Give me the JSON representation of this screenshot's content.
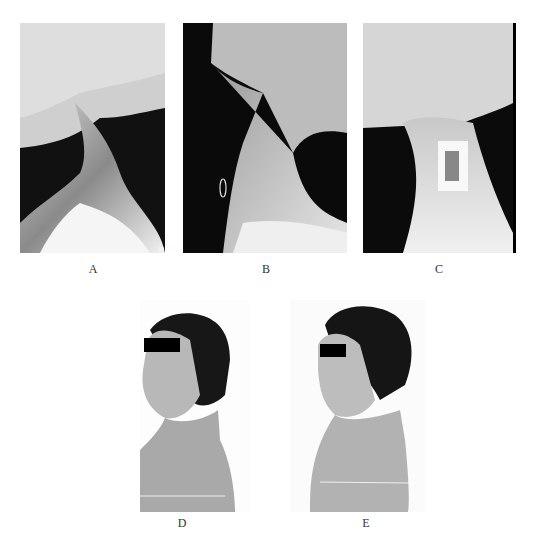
{
  "figure": {
    "panels": [
      {
        "id": "A",
        "label": "A",
        "type": "x-ray",
        "view": "lateral cervical spine",
        "overlay_text": "100"
      },
      {
        "id": "B",
        "label": "B",
        "type": "x-ray",
        "view": "lateral cervical spine"
      },
      {
        "id": "C",
        "label": "C",
        "type": "x-ray",
        "view": "lateral cervical spine with anterior plate fixation"
      },
      {
        "id": "D",
        "label": "D",
        "type": "photo",
        "view": "lateral profile, patient with eye bar"
      },
      {
        "id": "E",
        "label": "E",
        "type": "photo",
        "view": "lateral profile, patient with eye bar"
      }
    ]
  }
}
